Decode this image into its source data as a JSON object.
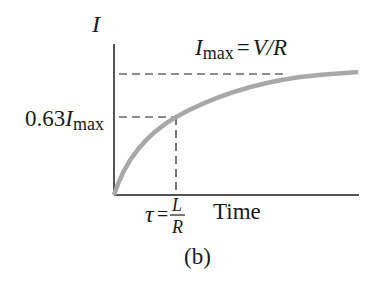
{
  "figure": {
    "panel_label": "(b)",
    "y_axis_label": "I",
    "x_axis_label": "Time",
    "imax_label": {
      "symbol": "I",
      "subscript": "max",
      "equals": "=",
      "expression": "V/R"
    },
    "level_label": {
      "coefficient": "0.63",
      "symbol": "I",
      "subscript": "max"
    },
    "tau_label": {
      "symbol": "τ",
      "equals": "=",
      "numerator": "L",
      "denominator": "R"
    },
    "colors": {
      "axis": "#1a1a1a",
      "curve": "#a8a8a8",
      "dashes": "#1a1a1a"
    }
  }
}
